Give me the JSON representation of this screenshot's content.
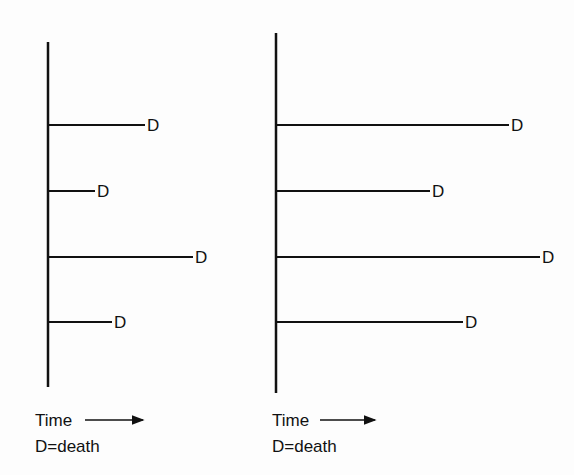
{
  "figure": {
    "panels": [
      {
        "id": "left",
        "axis": {
          "x": 48,
          "y_top": 42,
          "y_bottom": 387
        },
        "branches": [
          {
            "y": 125,
            "end_x": 145,
            "label": "D"
          },
          {
            "y": 191,
            "end_x": 95,
            "label": "D"
          },
          {
            "y": 257,
            "end_x": 193,
            "label": "D"
          },
          {
            "y": 322,
            "end_x": 112,
            "label": "D"
          }
        ],
        "legend": {
          "time_label": "Time",
          "death_label": "D=death",
          "x": 35,
          "time_y": 426,
          "death_y": 452,
          "arrow_x1": 85,
          "arrow_x2": 143
        }
      },
      {
        "id": "right",
        "axis": {
          "x": 276,
          "y_top": 33,
          "y_bottom": 393
        },
        "branches": [
          {
            "y": 125,
            "end_x": 509,
            "label": "D"
          },
          {
            "y": 191,
            "end_x": 430,
            "label": "D"
          },
          {
            "y": 257,
            "end_x": 540,
            "label": "D"
          },
          {
            "y": 322,
            "end_x": 463,
            "label": "D"
          }
        ],
        "legend": {
          "time_label": "Time",
          "death_label": "D=death",
          "x": 272,
          "time_y": 426,
          "death_y": 452,
          "arrow_x1": 320,
          "arrow_x2": 375
        }
      }
    ],
    "line_color": "#111111"
  }
}
